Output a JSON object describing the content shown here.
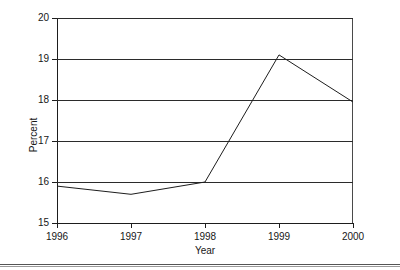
{
  "chart_data": {
    "type": "line",
    "title": "",
    "subtitle": "",
    "xlabel": "Year",
    "ylabel": "Percent",
    "categories": [
      "1996",
      "1997",
      "1998",
      "1999",
      "2000"
    ],
    "x": [
      1996,
      1997,
      1998,
      1999,
      2000
    ],
    "values": [
      15.9,
      15.7,
      16.0,
      19.1,
      17.95
    ],
    "series": [
      {
        "name": "Percent",
        "values": [
          15.9,
          15.7,
          16.0,
          19.1,
          17.95
        ]
      }
    ],
    "xlim": [
      1996,
      2000
    ],
    "ylim": [
      15,
      20
    ],
    "yticks": [
      15,
      16,
      17,
      18,
      19,
      20
    ],
    "ytick_labels": [
      "15",
      "16",
      "17",
      "18",
      "19",
      "20"
    ],
    "xticks": [
      1996,
      1997,
      1998,
      1999,
      2000
    ],
    "xtick_labels": [
      "1996",
      "1997",
      "1998",
      "1999",
      "2000"
    ],
    "grid": true,
    "grid_axis": "y",
    "legend": false,
    "legend_position": "none",
    "markers": false,
    "line_color": "#1d1d1d",
    "grid_color": "#2b2b2b",
    "background_color": "#ffffff",
    "annotations": []
  },
  "figure": {
    "y_axis_title": "Percent",
    "x_axis_title": "Year"
  }
}
